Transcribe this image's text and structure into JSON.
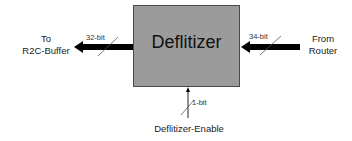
{
  "block": {
    "label": "Deflitizer",
    "fill": "#9b9b9b"
  },
  "output": {
    "label_line1": "To",
    "label_line2": "R2C-Buffer",
    "width_label": "32-bit"
  },
  "input": {
    "label_line1": "From",
    "label_line2": "Router",
    "width_label": "34-bit"
  },
  "control": {
    "label": "Deflitizer-Enable",
    "width_label": "1-bit"
  }
}
